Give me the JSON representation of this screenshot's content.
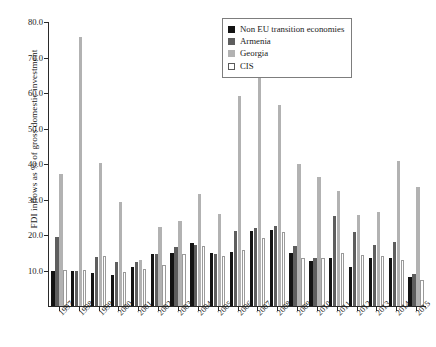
{
  "chart_data": {
    "type": "bar",
    "title": "",
    "xlabel": "",
    "ylabel": "FDI inflows as % of gross domestic investment",
    "ylim": [
      0,
      80
    ],
    "yticks": [
      "10.0",
      "20.0",
      "30.0",
      "40.0",
      "50.0",
      "60.0",
      "70.0",
      "80.0"
    ],
    "ytick_values": [
      10,
      20,
      30,
      40,
      50,
      60,
      70,
      80
    ],
    "grid": false,
    "legend_position": "top-right",
    "categories": [
      "1997",
      "1998",
      "1999",
      "2000",
      "2001",
      "2002",
      "2003",
      "2004",
      "2005",
      "2006",
      "2007",
      "2008",
      "2009",
      "2010",
      "2011",
      "2012",
      "2013",
      "2014",
      "2015"
    ],
    "series": [
      {
        "name": "Non EU transition economies",
        "color": "#131313",
        "values": [
          10.0,
          9.8,
          9.2,
          8.6,
          11.0,
          14.6,
          15.0,
          17.8,
          14.9,
          15.2,
          21.0,
          21.3,
          14.9,
          12.8,
          13.4,
          11.1,
          13.6,
          13.4,
          8.2
        ]
      },
      {
        "name": "Armenia",
        "color": "#5e5e5e",
        "values": [
          19.3,
          10.0,
          13.8,
          12.3,
          12.5,
          14.6,
          16.6,
          17.3,
          14.6,
          21.0,
          22.0,
          22.6,
          17.0,
          13.6,
          25.3,
          20.8,
          17.3,
          18.0,
          9.0
        ]
      },
      {
        "name": "Georgia",
        "color": "#b2b2b2",
        "values": [
          37.2,
          75.8,
          40.2,
          29.3,
          12.9,
          22.2,
          23.9,
          31.6,
          25.8,
          59.2,
          66.9,
          56.6,
          40.0,
          36.3,
          32.4,
          25.6,
          26.6,
          40.9,
          33.4
        ]
      },
      {
        "name": "CIS",
        "color": "#ffffff",
        "values": [
          10.1,
          10.2,
          14.1,
          9.6,
          10.4,
          11.6,
          14.7,
          17.0,
          14.0,
          15.9,
          19.2,
          20.8,
          13.4,
          13.4,
          14.8,
          14.5,
          14.0,
          13.1,
          7.2
        ]
      }
    ]
  }
}
